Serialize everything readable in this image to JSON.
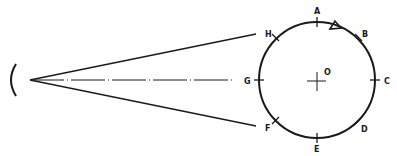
{
  "diagram": {
    "center_label": "O",
    "points": [
      {
        "id": "A",
        "label": "A",
        "angle": 90
      },
      {
        "id": "B",
        "label": "B",
        "angle": 45
      },
      {
        "id": "C",
        "label": "C",
        "angle": 0
      },
      {
        "id": "D",
        "label": "D",
        "angle": -45
      },
      {
        "id": "E",
        "label": "E",
        "angle": -90
      },
      {
        "id": "F",
        "label": "F",
        "angle": -135
      },
      {
        "id": "G",
        "label": "G",
        "angle": 180
      },
      {
        "id": "H",
        "label": "H",
        "angle": 135
      }
    ],
    "marker": "triangle",
    "line_color": "#1a1a1a"
  }
}
